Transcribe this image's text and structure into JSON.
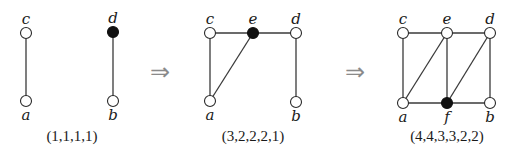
{
  "diagram": {
    "type": "graph-sequence",
    "arrow_symbol": "⇒",
    "stages": [
      {
        "caption": "(1,1,1,1)",
        "vertices": [
          {
            "id": "c",
            "label": "c",
            "x": 26,
            "y": 33,
            "filled": false,
            "label_pos": "above"
          },
          {
            "id": "a",
            "label": "a",
            "x": 26,
            "y": 101,
            "filled": false,
            "label_pos": "below"
          },
          {
            "id": "d",
            "label": "d",
            "x": 113,
            "y": 32,
            "filled": true,
            "label_pos": "above"
          },
          {
            "id": "b",
            "label": "b",
            "x": 113,
            "y": 101,
            "filled": false,
            "label_pos": "below"
          }
        ],
        "edges": [
          [
            "c",
            "a"
          ],
          [
            "d",
            "b"
          ]
        ],
        "caption_x": 72,
        "caption_y": 141
      },
      {
        "caption": "(3,2,2,2,1)",
        "vertices": [
          {
            "id": "c",
            "label": "c",
            "x": 210,
            "y": 33,
            "filled": false,
            "label_pos": "above"
          },
          {
            "id": "e",
            "label": "e",
            "x": 253,
            "y": 33,
            "filled": true,
            "label_pos": "above"
          },
          {
            "id": "d",
            "label": "d",
            "x": 296,
            "y": 33,
            "filled": false,
            "label_pos": "above"
          },
          {
            "id": "a",
            "label": "a",
            "x": 210,
            "y": 101,
            "filled": false,
            "label_pos": "below"
          },
          {
            "id": "b",
            "label": "b",
            "x": 296,
            "y": 102,
            "filled": false,
            "label_pos": "below"
          }
        ],
        "edges": [
          [
            "c",
            "e"
          ],
          [
            "e",
            "d"
          ],
          [
            "c",
            "a"
          ],
          [
            "a",
            "e"
          ],
          [
            "d",
            "b"
          ]
        ],
        "caption_x": 253,
        "caption_y": 141
      },
      {
        "caption": "(4,4,3,3,2,2)",
        "vertices": [
          {
            "id": "c",
            "label": "c",
            "x": 403,
            "y": 33,
            "filled": false,
            "label_pos": "above"
          },
          {
            "id": "e",
            "label": "e",
            "x": 447,
            "y": 33,
            "filled": false,
            "label_pos": "above"
          },
          {
            "id": "d",
            "label": "d",
            "x": 490,
            "y": 33,
            "filled": false,
            "label_pos": "above"
          },
          {
            "id": "a",
            "label": "a",
            "x": 403,
            "y": 103,
            "filled": false,
            "label_pos": "below"
          },
          {
            "id": "f",
            "label": "f",
            "x": 447,
            "y": 103,
            "filled": true,
            "label_pos": "below"
          },
          {
            "id": "b",
            "label": "b",
            "x": 490,
            "y": 103,
            "filled": false,
            "label_pos": "below"
          }
        ],
        "edges": [
          [
            "c",
            "e"
          ],
          [
            "e",
            "d"
          ],
          [
            "c",
            "a"
          ],
          [
            "a",
            "e"
          ],
          [
            "e",
            "f"
          ],
          [
            "f",
            "d"
          ],
          [
            "d",
            "b"
          ],
          [
            "a",
            "f"
          ],
          [
            "f",
            "b"
          ]
        ],
        "caption_x": 447,
        "caption_y": 141
      }
    ],
    "arrows": [
      {
        "x": 160,
        "y": 80
      },
      {
        "x": 355,
        "y": 80
      }
    ]
  }
}
